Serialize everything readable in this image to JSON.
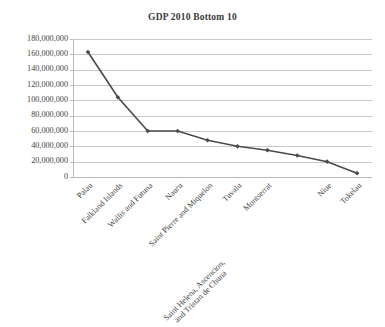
{
  "chart_data": {
    "type": "line",
    "title": "GDP 2010 Bottom 10",
    "xlabel": "",
    "ylabel": "",
    "ylim": [
      0,
      180000000
    ],
    "ytick_values": [
      0,
      20000000,
      40000000,
      60000000,
      80000000,
      100000000,
      120000000,
      140000000,
      160000000,
      180000000
    ],
    "ytick_labels": [
      "180,000,000",
      "160,000,000",
      "140,000,000",
      "120,000,000",
      "100,000,000",
      "80,000,000",
      "60,000,000",
      "40,000,000",
      "20,000,000",
      "0"
    ],
    "categories": [
      "Palau",
      "Falkland Islands",
      "Wallis and Futuna",
      "Nauru",
      "Saint Pierre and Miquelon",
      "Tuvalu",
      "Montserrat",
      "Saint Helena, Ascencion, and Tristan de Chuna",
      "Niue",
      "Tokelau"
    ],
    "categories_lines": [
      [
        "Palau"
      ],
      [
        "Falkland Islands"
      ],
      [
        "Wallis and Futuna"
      ],
      [
        "Nauru"
      ],
      [
        "Saint Pierre and Miquelon"
      ],
      [
        "Tuvalu"
      ],
      [
        "Montserrat"
      ],
      [
        "Saint Helena, Ascencion,",
        "and Tristan de Chuna"
      ],
      [
        "Niue"
      ],
      [
        "Tokelau"
      ]
    ],
    "values": [
      163000000,
      104000000,
      60000000,
      60000000,
      48000000,
      40000000,
      35000000,
      28000000,
      20000000,
      5000000
    ],
    "grid": true,
    "legend": false,
    "series_color": "#4a4a4a",
    "grid_color": "#c9c9c9",
    "marker": "diamond"
  }
}
